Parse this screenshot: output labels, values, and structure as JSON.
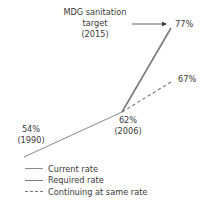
{
  "chart_data": {
    "type": "line",
    "title": "",
    "xlabel": "",
    "ylabel": "",
    "x_range": [
      1990,
      2015
    ],
    "y_range": [
      54,
      77
    ],
    "series": [
      {
        "name": "Current rate",
        "style": "solid-thin",
        "color": "#8a8a8a",
        "points": [
          {
            "x": 1990,
            "y": 54
          },
          {
            "x": 2006,
            "y": 62
          }
        ]
      },
      {
        "name": "Required rate",
        "style": "solid-thick",
        "color": "#7a7a7a",
        "points": [
          {
            "x": 2006,
            "y": 62
          },
          {
            "x": 2015,
            "y": 77
          }
        ]
      },
      {
        "name": "Continuing at same rate",
        "style": "dashed",
        "color": "#7a7a7a",
        "points": [
          {
            "x": 2006,
            "y": 62
          },
          {
            "x": 2015,
            "y": 67
          }
        ]
      }
    ],
    "annotations": [
      {
        "id": "start",
        "lines": [
          "54%",
          "(1990)"
        ]
      },
      {
        "id": "mid",
        "lines": [
          "62%",
          "(2006)"
        ]
      },
      {
        "id": "target",
        "lines": [
          "77%"
        ]
      },
      {
        "id": "continuing",
        "lines": [
          "67%"
        ]
      },
      {
        "id": "mdg",
        "lines": [
          "MDG sanitation",
          "target",
          "(2015)"
        ]
      }
    ],
    "legend": {
      "placement": "bottom-left",
      "entries": [
        "Current rate",
        "Required rate",
        "Continuing at same rate"
      ]
    }
  }
}
